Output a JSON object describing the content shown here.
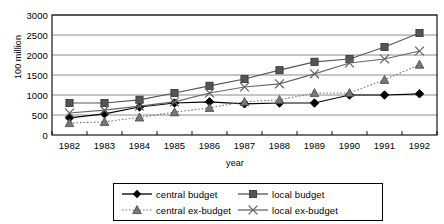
{
  "chart_data": {
    "type": "line",
    "title": "",
    "xlabel": "year",
    "ylabel": "100 million",
    "categories": [
      "1982",
      "1983",
      "1984",
      "1985",
      "1986",
      "1987",
      "1988",
      "1989",
      "1990",
      "1991",
      "1992"
    ],
    "x": [
      1982,
      1983,
      1984,
      1985,
      1986,
      1987,
      1988,
      1989,
      1990,
      1991,
      1992
    ],
    "ylim": [
      0,
      3000
    ],
    "yticks": [
      0,
      500,
      1000,
      1500,
      2000,
      2500,
      3000
    ],
    "grid": true,
    "legend_position": "bottom",
    "series": [
      {
        "name": "central budget",
        "marker": "diamond",
        "line_style": "solid",
        "color": "#000000",
        "values": [
          430,
          530,
          700,
          800,
          830,
          780,
          800,
          800,
          1000,
          1000,
          1030
        ]
      },
      {
        "name": "local budget",
        "marker": "square",
        "line_style": "solid",
        "color": "#555555",
        "values": [
          800,
          800,
          880,
          1050,
          1230,
          1400,
          1620,
          1830,
          1900,
          2200,
          2550
        ]
      },
      {
        "name": "central ex-budget",
        "marker": "triangle",
        "line_style": "dotted",
        "color": "#777777",
        "values": [
          300,
          330,
          440,
          570,
          680,
          830,
          880,
          1050,
          1050,
          1380,
          1760
        ]
      },
      {
        "name": "local ex-budget",
        "marker": "cross",
        "line_style": "solid",
        "color": "#666666",
        "values": [
          550,
          620,
          720,
          830,
          1050,
          1200,
          1280,
          1530,
          1800,
          1900,
          2100
        ]
      }
    ]
  },
  "axis": {
    "y_label": "100 million",
    "x_label": "year",
    "y_ticks": [
      "0",
      "500",
      "1000",
      "1500",
      "2000",
      "2500",
      "3000"
    ],
    "x_ticks": [
      "1982",
      "1983",
      "1984",
      "1985",
      "1986",
      "1987",
      "1988",
      "1989",
      "1990",
      "1991",
      "1992"
    ]
  },
  "legend": {
    "items": [
      {
        "label": "central budget",
        "marker": "diamond-marker-icon"
      },
      {
        "label": "local budget",
        "marker": "square-marker-icon"
      },
      {
        "label": "central ex-budget",
        "marker": "triangle-marker-icon"
      },
      {
        "label": "local ex-budget",
        "marker": "cross-marker-icon"
      }
    ]
  },
  "colors": {
    "plot_border": "#000000",
    "grid": "#808080",
    "background": "#ffffff",
    "central_budget": "#000000",
    "local_budget": "#555555",
    "central_ex_budget": "#777777",
    "local_ex_budget": "#666666"
  }
}
